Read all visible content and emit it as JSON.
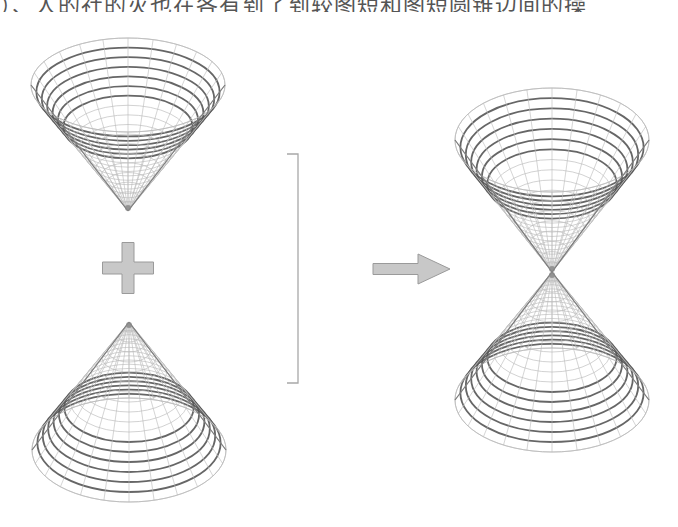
{
  "caption": {
    "text_cropped": "）、人的社的灭也在各有到了到较图短和图短圆锥边间的操"
  },
  "colors": {
    "background": "#ffffff",
    "ring_thick": "#555555",
    "mesh_light": "#bdbdbd",
    "shape_fill": "#c8c8c8",
    "shape_stroke": "#9a9a9a",
    "bracket": "#a8a8a8"
  },
  "diagram": {
    "left_group": {
      "top_cone": {
        "name": "cone-opening-up",
        "cx": 128,
        "rim_y": 85,
        "rx": 97,
        "ry": 47,
        "apex_y": 211,
        "orientation": "down"
      },
      "operator": {
        "symbol": "plus",
        "cx": 128,
        "cy": 268,
        "arm_length": 51,
        "arm_thickness": 12
      },
      "bottom_cone": {
        "name": "cone-opening-down",
        "cx": 129,
        "rim_y": 450,
        "rx": 97,
        "ry": 52,
        "apex_y": 322,
        "orientation": "up"
      }
    },
    "bracket": {
      "x": 298,
      "y_top": 154,
      "y_bottom": 383,
      "tick_length": 11
    },
    "arrow": {
      "x_start": 373,
      "x_end": 450,
      "cy": 269,
      "shaft_height": 11,
      "head_start": 418,
      "head_height": 30
    },
    "right_group": {
      "top_cone": {
        "name": "double-cone-upper-nappe",
        "cx": 552,
        "rim_y": 140,
        "rx": 97,
        "ry": 52,
        "apex_y": 272,
        "orientation": "down"
      },
      "bottom_cone": {
        "name": "double-cone-lower-nappe",
        "cx": 552,
        "rim_y": 400,
        "rx": 97,
        "ry": 52,
        "apex_y": 272,
        "orientation": "up"
      }
    },
    "mesh": {
      "rings": 18,
      "thick_rings": 6,
      "meridians": 24
    }
  }
}
